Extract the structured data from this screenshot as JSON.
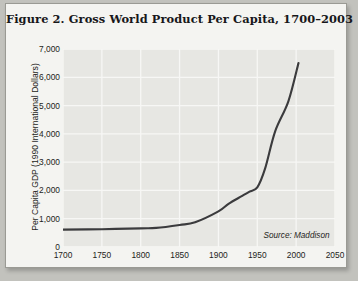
{
  "figure": {
    "title": "Figure 2. Gross World Product Per Capita, 1700–2003",
    "source_note": "Source: Maddison"
  },
  "bleed_text": {
    "line1": "Figure 1. Global Average Te",
    "line2": "Concentration",
    "line3": "Sea Surface Temperature Dat"
  },
  "colors": {
    "page": "#c2c2bd",
    "paper": "#f4f4f1",
    "plot_background": "#e7e7e3",
    "gridline": "#f7f7f5",
    "line": "#3b3b3d",
    "text": "#1d1d20"
  },
  "chart_data": {
    "type": "line",
    "title": "Figure 2. Gross World Product Per Capita, 1700–2003",
    "xlabel": "",
    "ylabel": "Per Capita GDP (1990 International Dollars)",
    "xlim": [
      1700,
      2050
    ],
    "ylim": [
      0,
      7000
    ],
    "xticks": [
      1700,
      1750,
      1800,
      1850,
      1900,
      1950,
      2000,
      2050
    ],
    "yticks": [
      0,
      1000,
      2000,
      3000,
      4000,
      5000,
      6000,
      7000
    ],
    "ytick_labels": [
      "0",
      "1,000",
      "2,000",
      "3,000",
      "4,000",
      "5,000",
      "6,000",
      "7,000"
    ],
    "xtick_labels": [
      "1700",
      "1750",
      "1800",
      "1850",
      "1900",
      "1950",
      "2000",
      "2050"
    ],
    "grid": true,
    "legend": null,
    "annotations": [
      {
        "text": "Source: Maddison",
        "x": 1958,
        "y": 560,
        "style": "italic"
      }
    ],
    "series": [
      {
        "name": "Gross World Product Per Capita",
        "x": [
          1700,
          1750,
          1800,
          1820,
          1850,
          1870,
          1900,
          1913,
          1930,
          1940,
          1950,
          1960,
          1973,
          1990,
          2003
        ],
        "values": [
          615,
          630,
          660,
          675,
          780,
          875,
          1260,
          1525,
          1800,
          1960,
          2110,
          2770,
          4090,
          5150,
          6500
        ]
      }
    ]
  }
}
